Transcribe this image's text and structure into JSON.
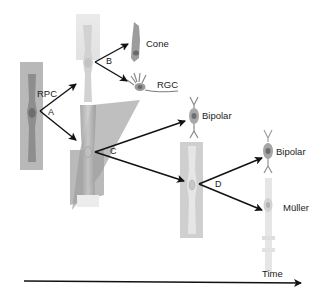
{
  "diagram": {
    "title": "",
    "colors": {
      "background": "#ffffff",
      "arrow": "#111111",
      "cell_dark": "#8a8a8a",
      "cell_mid": "#b4b4b4",
      "cell_light": "#dcdcdc",
      "highlight_box": "#d8d8d8",
      "shadow_wedge": "#a8a8a8"
    },
    "nodes": [
      {
        "id": "rpc",
        "label": "RPC",
        "type": "progenitor"
      },
      {
        "id": "cone",
        "label": "Cone",
        "type": "neuron"
      },
      {
        "id": "rgc",
        "label": "RGC",
        "type": "neuron"
      },
      {
        "id": "bipolar1",
        "label": "Bipolar",
        "type": "neuron"
      },
      {
        "id": "bipolar2",
        "label": "Bipolar",
        "type": "neuron"
      },
      {
        "id": "muller",
        "label": "Müller",
        "type": "glia"
      }
    ],
    "divisions": [
      {
        "label": "A",
        "from": "rpc",
        "to": [
          "early_progenitor",
          "mid_progenitor"
        ]
      },
      {
        "label": "B",
        "from": "early_progenitor",
        "to": [
          "cone",
          "rgc"
        ]
      },
      {
        "label": "C",
        "from": "mid_progenitor",
        "to": [
          "bipolar1",
          "late_progenitor"
        ]
      },
      {
        "label": "D",
        "from": "late_progenitor",
        "to": [
          "bipolar2",
          "muller"
        ]
      }
    ],
    "time_axis": {
      "label": "Time"
    }
  }
}
